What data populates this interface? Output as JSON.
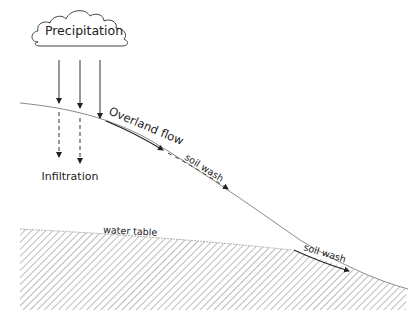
{
  "diagram": {
    "labels": {
      "cloud": "Precipitation",
      "infiltration": "Infiltration",
      "overland_flow": "Overland flow",
      "soil_wash_upper": "soil wash",
      "soil_wash_lower": "soil wash",
      "water_table": "water table"
    },
    "colors": {
      "line": "#333333",
      "slope": "#888888",
      "hatch": "#9a9a9a",
      "text": "#222222"
    }
  }
}
